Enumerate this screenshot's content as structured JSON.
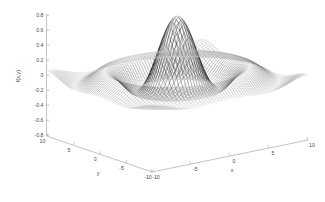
{
  "figure": {
    "background_color": "#ffffff",
    "mesh_color": "#1a1a1a",
    "axis_color": "#9a9a9a",
    "text_color": "#4a4a4a"
  },
  "chart_data": {
    "type": "surface",
    "title": "",
    "subtitle": "",
    "xlabel": "x",
    "ylabel": "y",
    "zlabel": "f(x,y)",
    "xlim": [
      -10,
      10
    ],
    "ylim": [
      -10,
      10
    ],
    "zlim": [
      -0.8,
      0.8
    ],
    "xticks": [
      -10,
      -5,
      0,
      5,
      10
    ],
    "xticklabels": [
      "-10",
      "-5",
      "0",
      "5",
      "10"
    ],
    "yticks": [
      10,
      5,
      0,
      -5,
      -10
    ],
    "yticklabels": [
      "10",
      "5",
      "0",
      "-5",
      "-10"
    ],
    "zticks": [
      -0.8,
      -0.6,
      -0.4,
      -0.2,
      0,
      0.2,
      0.4,
      0.6,
      0.8
    ],
    "zticklabels": [
      "-0.8",
      "-0.6",
      "-0.4",
      "-0.2",
      "0",
      "0.2",
      "0.4",
      "0.6",
      "0.8"
    ],
    "grid": false,
    "legend": null,
    "legend_position": "none",
    "style": "wireframe-mesh",
    "mesh_samples": 61,
    "function": "sinc-like radial wave",
    "peak_value": 0.8,
    "trough_value": -0.8,
    "view_azimuth": -37.5,
    "view_elevation": 30,
    "annotations": []
  },
  "labels": {
    "x_axis": "x",
    "y_axis": "y",
    "z_axis": "f(x,y)"
  }
}
